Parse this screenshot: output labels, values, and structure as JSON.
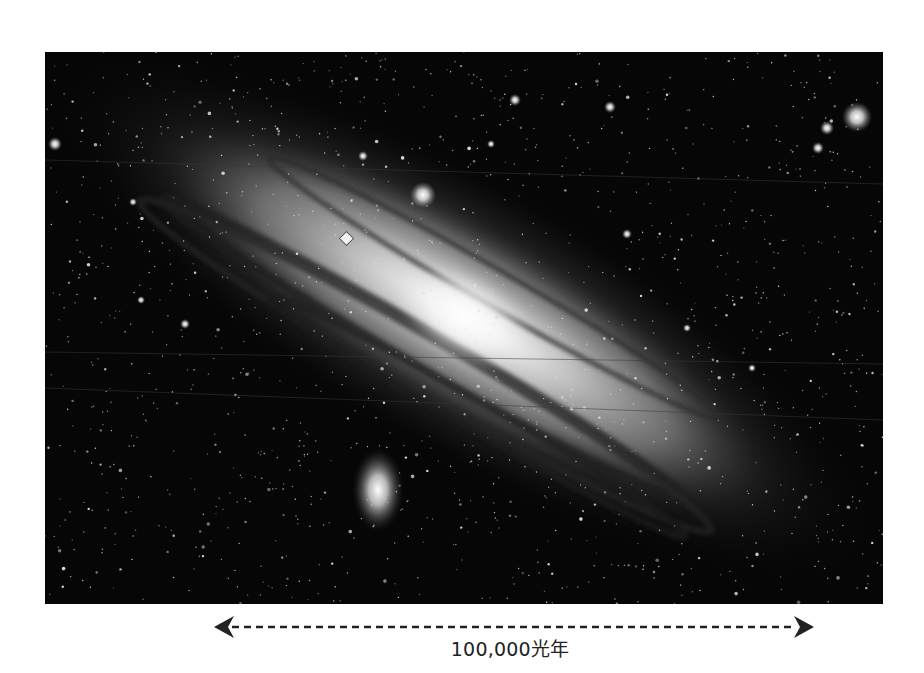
{
  "figure": {
    "image_type": "grayscale astronomical photograph",
    "marker": {
      "shape": "diamond",
      "description": "position marker on galaxy disk"
    },
    "scale_bar": {
      "label": "100,000光年",
      "style": "dashed double-headed arrow"
    },
    "colors": {
      "background": "#ffffff",
      "sky": "#050505",
      "scale_bar": "#222222",
      "marker_fill": "#f2f2f2"
    }
  }
}
